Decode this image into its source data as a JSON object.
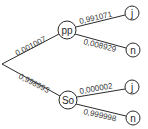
{
  "tree": {
    "root": {
      "x": 2,
      "y": 64
    },
    "nodes": [
      {
        "id": "pp",
        "label": "pp",
        "x": 67,
        "y": 30,
        "r": 9
      },
      {
        "id": "so",
        "label": "So",
        "x": 68,
        "y": 100,
        "r": 9
      },
      {
        "id": "pp_j",
        "label": "j",
        "x": 132,
        "y": 13,
        "r": 7
      },
      {
        "id": "pp_n",
        "label": "n",
        "x": 133,
        "y": 50,
        "r": 7
      },
      {
        "id": "so_j",
        "label": "j",
        "x": 132,
        "y": 87,
        "r": 7
      },
      {
        "id": "so_n",
        "label": "n",
        "x": 133,
        "y": 118,
        "r": 7
      }
    ],
    "edges": [
      {
        "from": "root",
        "to": "pp",
        "probability": "0,001007"
      },
      {
        "from": "root",
        "to": "so",
        "probability": "0,998993"
      },
      {
        "from": "pp",
        "to": "pp_j",
        "probability": "0,991071"
      },
      {
        "from": "pp",
        "to": "pp_n",
        "probability": "0,008929"
      },
      {
        "from": "so",
        "to": "so_j",
        "probability": "0,000002"
      },
      {
        "from": "so",
        "to": "so_n",
        "probability": "0,999998"
      }
    ]
  }
}
